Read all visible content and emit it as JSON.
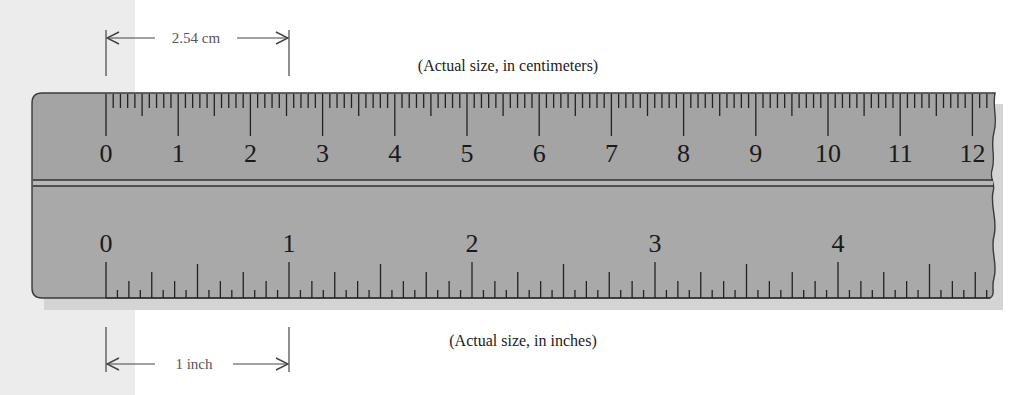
{
  "captions": {
    "top": "(Actual size, in centimeters)",
    "bottom": "(Actual size, in inches)"
  },
  "dimensions": {
    "cm_label": "2.54 cm",
    "inch_label": "1 inch"
  },
  "ruler": {
    "cm_scale": {
      "labels": [
        "0",
        "1",
        "2",
        "3",
        "4",
        "5",
        "6",
        "7",
        "8",
        "9",
        "10",
        "11",
        "12"
      ],
      "unit": "cm",
      "minor_division": "mm"
    },
    "inch_scale": {
      "labels": [
        "0",
        "1",
        "2",
        "3",
        "4"
      ],
      "unit": "inch",
      "minor_division": "1/16 inch"
    }
  },
  "colors": {
    "ruler_fill": "#a8a8a8",
    "ruler_fill_top": "#9f9f9f",
    "ruler_edge": "#3a3a3a",
    "tick": "#222222",
    "shadow": "#d0d0d0",
    "caption_text": "#222222",
    "dimension_text": "#555555"
  }
}
